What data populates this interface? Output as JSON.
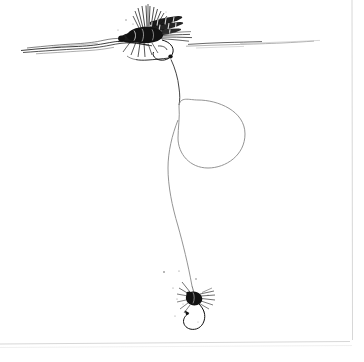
{
  "artwork": {
    "title": "Dry-Dropper Fly Rig",
    "medium": "pen and ink line drawing",
    "background_color": "#ffffff",
    "ink_color": "#111111",
    "line_color": "#8e8e8e",
    "border_color": "#d7d7d7",
    "width": 364,
    "height": 362
  },
  "elements": {
    "waterline_label": "water surface line",
    "dry_fly_label": "dry fly at surface",
    "tippet_label": "tippet monofilament",
    "loop_label": "tippet loop circle",
    "nymph_label": "dropper nymph fly",
    "hook_label": "hook bend and point",
    "speck_label": "ink speck"
  },
  "geometry": {
    "waterline_y": 46,
    "waterline_left_x": 20,
    "waterline_right_x": 320,
    "dry_fly_center": {
      "x": 152,
      "y": 33
    },
    "loop_center": {
      "x": 211,
      "y": 134
    },
    "loop_radius_x": 34,
    "loop_radius_y": 34,
    "nymph_center": {
      "x": 193,
      "y": 297
    },
    "border_right_x": 352,
    "border_bottom_y": 345
  }
}
